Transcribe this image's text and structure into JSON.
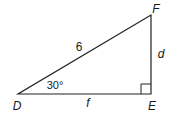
{
  "diagram": {
    "type": "right-triangle",
    "stroke_color": "#222222",
    "vertices": {
      "D": {
        "label": "D",
        "x": 18,
        "y": 94
      },
      "E": {
        "label": "E",
        "x": 151,
        "y": 94
      },
      "F": {
        "label": "F",
        "x": 151,
        "y": 15
      }
    },
    "sides": {
      "DF": {
        "label": "6"
      },
      "FE": {
        "label": "d"
      },
      "DE": {
        "label": "f"
      }
    },
    "angles": {
      "D": {
        "label": "30°"
      },
      "E": {
        "right_angle": true
      }
    }
  }
}
